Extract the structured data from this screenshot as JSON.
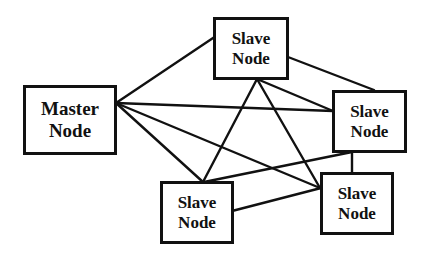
{
  "diagram": {
    "type": "network-topology",
    "nodes": [
      {
        "id": "master",
        "line1": "Master",
        "line2": "Node"
      },
      {
        "id": "slave_top",
        "line1": "Slave",
        "line2": "Node"
      },
      {
        "id": "slave_right",
        "line1": "Slave",
        "line2": "Node"
      },
      {
        "id": "slave_bottom_left",
        "line1": "Slave",
        "line2": "Node"
      },
      {
        "id": "slave_bottom_right",
        "line1": "Slave",
        "line2": "Node"
      }
    ],
    "edges": [
      [
        "master",
        "slave_top"
      ],
      [
        "master",
        "slave_right"
      ],
      [
        "master",
        "slave_bottom_left"
      ],
      [
        "master",
        "slave_bottom_right"
      ],
      [
        "slave_top",
        "slave_right"
      ],
      [
        "slave_top",
        "slave_bottom_left"
      ],
      [
        "slave_top",
        "slave_bottom_right"
      ],
      [
        "slave_top",
        "slave_right"
      ],
      [
        "slave_right",
        "slave_bottom_left"
      ],
      [
        "slave_right",
        "slave_bottom_right"
      ],
      [
        "slave_bottom_left",
        "slave_bottom_right"
      ]
    ],
    "colors": {
      "stroke": "#111111",
      "background": "#ffffff"
    }
  }
}
